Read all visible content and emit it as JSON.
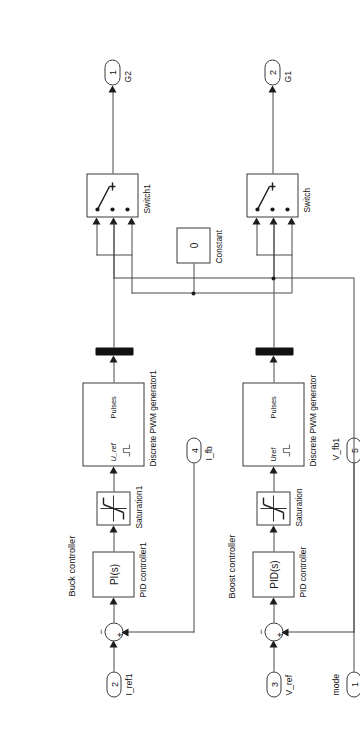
{
  "diagram": {
    "tool": "Simulink block diagram",
    "orientation": "rotated-90"
  },
  "inports": [
    {
      "number": "1",
      "label": "mode",
      "name": "inport-mode"
    },
    {
      "number": "2",
      "label": "I_ref1",
      "name": "inport-i-ref1"
    },
    {
      "number": "3",
      "label": "V_ref",
      "name": "inport-v-ref"
    },
    {
      "number": "4",
      "label": "I_fb",
      "name": "inport-i-fb"
    },
    {
      "number": "5",
      "label": "V_fb1",
      "name": "inport-v-fb1"
    }
  ],
  "outports": [
    {
      "number": "1",
      "label": "G2",
      "name": "outport-g2"
    },
    {
      "number": "2",
      "label": "G1",
      "name": "outport-g1"
    }
  ],
  "blocks": {
    "switch1": {
      "label": "Switch1",
      "name": "switch1-block"
    },
    "switch": {
      "label": "Switch",
      "name": "switch-block"
    },
    "constant": {
      "label": "Constant",
      "value": "0",
      "name": "constant-block"
    },
    "pwm1": {
      "label": "Discrete PWM generator1",
      "in": "U_ref",
      "out": "Pulses",
      "name": "discrete-pwm-generator1-block"
    },
    "pwm": {
      "label": "Discrete PWM generator",
      "in": "Uref",
      "out": "Pulses",
      "name": "discrete-pwm-generator-block"
    },
    "sat1": {
      "label": "Saturation1",
      "name": "saturation1-block"
    },
    "sat": {
      "label": "Saturation",
      "name": "saturation-block"
    },
    "pid1": {
      "label": "PID controller1",
      "expr": "PI(s)",
      "name": "pid-controller1-block"
    },
    "pid": {
      "label": "PID controller",
      "expr": "PID(s)",
      "name": "pid-controller-block"
    },
    "sum1": {
      "plus": "+",
      "minus": "−",
      "name": "sum-junction-buck"
    },
    "sum2": {
      "plus": "+",
      "minus": "−",
      "name": "sum-junction-boost"
    }
  },
  "annotations": [
    {
      "text": "Buck controller",
      "name": "annotation-buck-controller"
    },
    {
      "text": "Boost controller",
      "name": "annotation-boost-controller"
    }
  ],
  "colors": {
    "background": "#ffffff",
    "block_border": "#3a3a3a",
    "wire": "#4a4a4a",
    "text": "#111111",
    "mux": "#111111"
  }
}
